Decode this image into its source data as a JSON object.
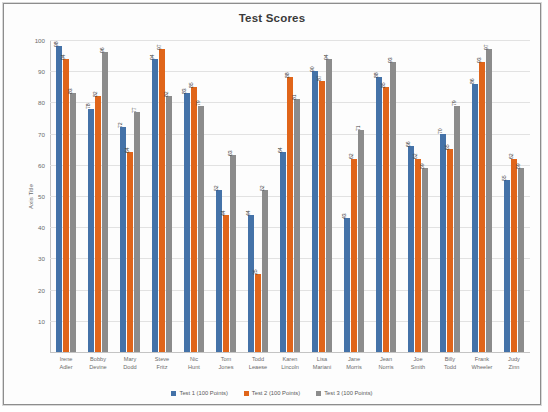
{
  "chart_data": {
    "type": "bar",
    "title": "Test Scores",
    "xlabel": "",
    "ylabel": "Axis Title",
    "ylim": [
      0,
      100
    ],
    "ytick_step": 10,
    "yticks": [
      0,
      10,
      20,
      30,
      40,
      50,
      60,
      70,
      80,
      90,
      100
    ],
    "grid": true,
    "legend_position": "bottom",
    "categories": [
      "Irene Adler",
      "Bobby Devine",
      "Mary Dodd",
      "Steve Fritz",
      "Nic Hunt",
      "Tom Jones",
      "Todd Leaese",
      "Karen Lincoln",
      "Lisa Mariani",
      "Jane Morris",
      "Jean Norris",
      "Joe Smith",
      "Billy Todd",
      "Frank Wheeler",
      "Judy Zinn"
    ],
    "series": [
      {
        "name": "Test 1 (100 Points)",
        "color": "#4472a8",
        "values": [
          98,
          78,
          72,
          94,
          83,
          52,
          44,
          64,
          90,
          43,
          88,
          66,
          70,
          86,
          55
        ]
      },
      {
        "name": "Test 2 (100 Points)",
        "color": "#e0651a",
        "values": [
          94,
          82,
          64,
          97,
          85,
          44,
          25,
          88,
          87,
          62,
          85,
          62,
          65,
          93,
          62
        ]
      },
      {
        "name": "Test 3 (100 Points)",
        "color": "#8c8c8c",
        "values": [
          83,
          96,
          77,
          82,
          79,
          63,
          52,
          81,
          94,
          71,
          93,
          59,
          79,
          97,
          59
        ]
      }
    ]
  },
  "legend": {
    "items": [
      {
        "label": "Test 1 (100 Points)",
        "color": "#4472a8"
      },
      {
        "label": "Test 2 (100 Points)",
        "color": "#e0651a"
      },
      {
        "label": "Test 3 (100 Points)",
        "color": "#8c8c8c"
      }
    ]
  }
}
